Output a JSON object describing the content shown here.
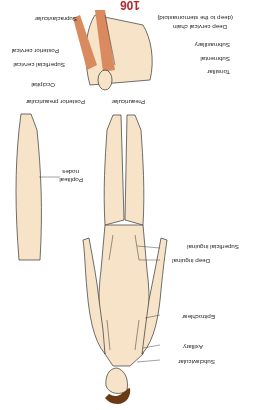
{
  "page": {
    "number": "106",
    "orientation": "rotated-180",
    "accent_color": "#b0282a",
    "skin_color": "#f7e3c8",
    "hair_color": "#6b3a12",
    "muscle_color": "#d98a5f"
  },
  "figure": {
    "head_neck_labels": {
      "left": [
        "Preauricular",
        "Posterior preauricular",
        "Occipital",
        "Superficial cervical",
        "Posterior cervical",
        "Supraclavicular"
      ],
      "right": [
        "Tonsillar",
        "Submental",
        "Submaxillary",
        "Deep cervical chain",
        "(deep to the sternomastoid)"
      ]
    },
    "body_labels": [
      "Subclavicular",
      "Axillary",
      "Epitrochlear",
      "Deep inguinal",
      "Superficial inguinal"
    ],
    "leg_labels": [
      "Popliteal",
      "nodes"
    ]
  }
}
